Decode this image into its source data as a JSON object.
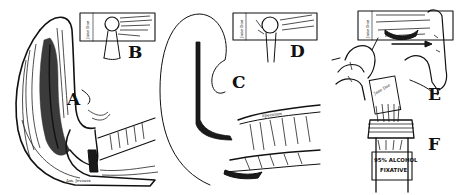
{
  "figure": {
    "panels": [
      {
        "letter": "A",
        "subject": "sagittal section of uterus and cervix with spatula scraping"
      },
      {
        "letter": "B",
        "subject": "smear applied to labeled glass slide"
      },
      {
        "letter": "C",
        "subject": "pipette / swab inserted through speculum"
      },
      {
        "letter": "D",
        "subject": "second smear applied to labeled slide"
      },
      {
        "letter": "E",
        "subject": "hands spreading material across slide"
      },
      {
        "letter": "F",
        "subject": "slide placed into fixative bottle"
      }
    ],
    "slide_label": "Jane Doe",
    "speculum_label": "Speculum",
    "bottle_label_line1": "95% ALCOHOL",
    "bottle_label_line2": "FIXATIVE",
    "signature": "Am. Jevoura"
  }
}
